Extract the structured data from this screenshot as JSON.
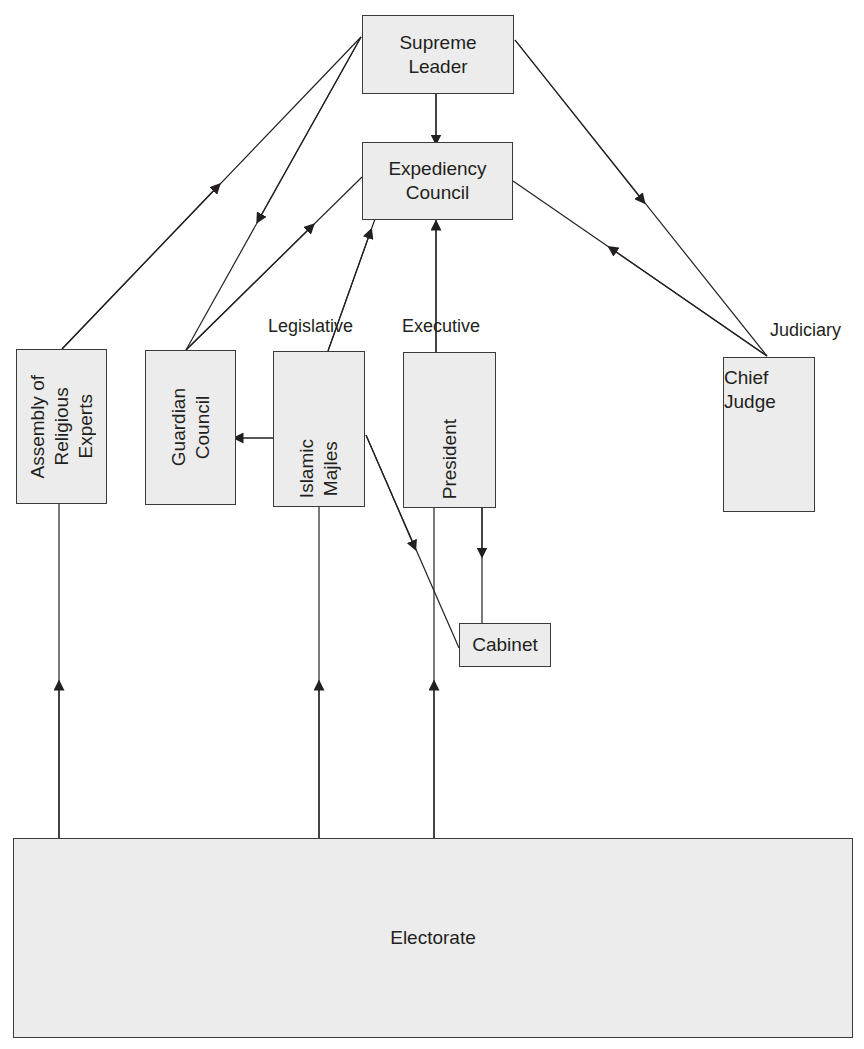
{
  "diagram": {
    "nodes": {
      "supreme_leader": {
        "line1": "Supreme",
        "line2": "Leader"
      },
      "expediency_council": {
        "line1": "Expediency",
        "line2": "Council"
      },
      "assembly": {
        "line1": "Assembly of",
        "line2": "Religious",
        "line3": "Experts"
      },
      "guardian_council": {
        "line1": "Guardian",
        "line2": "Council"
      },
      "islamic_majles": {
        "line1": "Islamic",
        "line2": "Majles"
      },
      "president": {
        "line1": "President"
      },
      "chief_judge": {
        "line1": "Chief",
        "line2": "Judge"
      },
      "cabinet": {
        "line1": "Cabinet"
      },
      "electorate": {
        "line1": "Electorate"
      }
    },
    "branch_labels": {
      "legislative": "Legislative",
      "executive": "Executive",
      "judiciary": "Judiciary"
    },
    "edges": [
      {
        "from": "Assembly of Religious Experts",
        "to": "Supreme Leader"
      },
      {
        "from": "Supreme Leader",
        "to": "Guardian Council"
      },
      {
        "from": "Guardian Council",
        "to": "Expediency Council"
      },
      {
        "from": "Supreme Leader",
        "to": "Expediency Council"
      },
      {
        "from": "Islamic Majles",
        "to": "Expediency Council"
      },
      {
        "from": "President",
        "to": "Expediency Council"
      },
      {
        "from": "Supreme Leader",
        "to": "Chief Judge"
      },
      {
        "from": "Chief Judge",
        "to": "Expediency Council"
      },
      {
        "from": "Islamic Majles",
        "to": "Guardian Council"
      },
      {
        "from": "Islamic Majles",
        "to": "Cabinet"
      },
      {
        "from": "President",
        "to": "Cabinet"
      },
      {
        "from": "Electorate",
        "to": "Assembly of Religious Experts"
      },
      {
        "from": "Electorate",
        "to": "Islamic Majles"
      },
      {
        "from": "Electorate",
        "to": "President"
      }
    ],
    "colors": {
      "box_fill": "#ececec",
      "line": "#231f20"
    }
  }
}
